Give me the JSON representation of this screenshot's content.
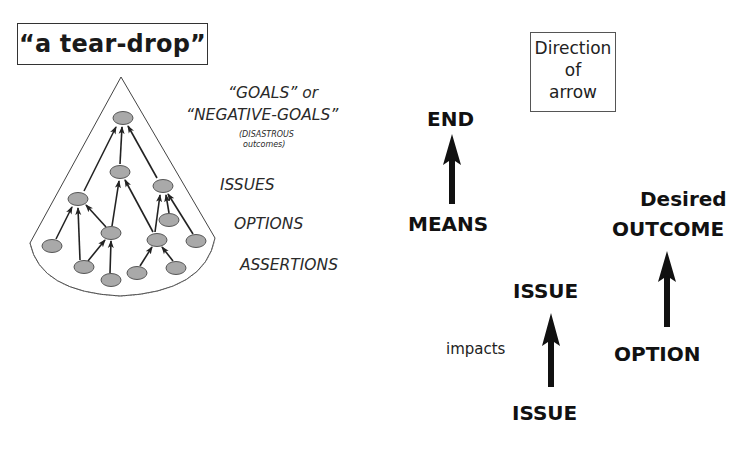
{
  "left_panel": {
    "title": "“a tear-drop”",
    "level_labels": {
      "goals": "“GOALS” or",
      "negative_goals": "“NEGATIVE-GOALS”",
      "disastrous": "(DISASTROUS",
      "outcomes": "outcomes)",
      "issues": "ISSUES",
      "options": "OPTIONS",
      "assertions": "ASSERTIONS"
    },
    "tree": {
      "node_fill": "#a9a9a9",
      "node_stroke": "#555555",
      "nodes": [
        {
          "id": "goal",
          "x": 123,
          "y": 118
        },
        {
          "id": "issue-mid",
          "x": 120,
          "y": 172
        },
        {
          "id": "issue-right",
          "x": 163,
          "y": 186
        },
        {
          "id": "issue-left",
          "x": 78,
          "y": 199
        },
        {
          "id": "option-right-small",
          "x": 169,
          "y": 220
        },
        {
          "id": "option-center-left",
          "x": 111,
          "y": 233
        },
        {
          "id": "option-center-right",
          "x": 157,
          "y": 240
        },
        {
          "id": "option-far-right",
          "x": 196,
          "y": 241
        },
        {
          "id": "assertion-far-left",
          "x": 52,
          "y": 246
        },
        {
          "id": "assertion-bottom-left",
          "x": 84,
          "y": 267
        },
        {
          "id": "assertion-bottom-right",
          "x": 176,
          "y": 268
        },
        {
          "id": "assertion-bottom-center-right",
          "x": 137,
          "y": 273
        },
        {
          "id": "assertion-bottom-center",
          "x": 111,
          "y": 280
        }
      ]
    }
  },
  "right_panel": {
    "direction_box": {
      "line1": "Direction",
      "line2": "of",
      "line3": "arrow"
    },
    "pairs": [
      {
        "top": "END",
        "bottom": "MEANS"
      },
      {
        "top_line1": "Desired",
        "top_line2": "OUTCOME",
        "bottom": "OPTION"
      },
      {
        "top": "ISSUE",
        "bottom": "ISSUE",
        "relation": "impacts"
      }
    ]
  }
}
